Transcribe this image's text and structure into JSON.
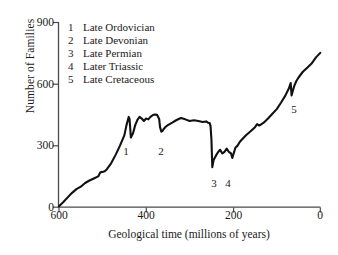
{
  "chart_data": {
    "type": "line",
    "title": "",
    "xlabel": "Geological time (millions of years)",
    "ylabel": "Number of Families",
    "xlim": [
      600,
      0
    ],
    "ylim": [
      0,
      900
    ],
    "x_ticks": [
      600,
      400,
      200,
      0
    ],
    "y_ticks": [
      0,
      300,
      600,
      900
    ],
    "x_reversed": true,
    "grid": false,
    "legend_position": "top-left-inside",
    "series_name": "Number of families",
    "line_color": "#000000",
    "x": [
      600,
      590,
      580,
      570,
      560,
      550,
      540,
      530,
      520,
      510,
      505,
      500,
      495,
      490,
      480,
      470,
      460,
      450,
      445,
      440,
      438,
      435,
      430,
      425,
      420,
      415,
      410,
      405,
      400,
      395,
      390,
      385,
      380,
      375,
      370,
      368,
      365,
      362,
      360,
      355,
      350,
      340,
      330,
      320,
      310,
      300,
      290,
      280,
      270,
      262,
      258,
      254,
      252,
      250,
      248,
      245,
      240,
      235,
      230,
      225,
      220,
      215,
      210,
      205,
      202,
      200,
      198,
      195,
      190,
      185,
      180,
      170,
      160,
      150,
      145,
      140,
      130,
      120,
      110,
      100,
      90,
      80,
      72,
      68,
      66,
      64,
      60,
      55,
      50,
      40,
      30,
      20,
      10,
      0
    ],
    "y": [
      5,
      25,
      48,
      70,
      88,
      100,
      118,
      130,
      140,
      150,
      170,
      172,
      175,
      185,
      215,
      255,
      300,
      350,
      400,
      440,
      430,
      340,
      360,
      400,
      425,
      440,
      432,
      420,
      432,
      428,
      440,
      448,
      452,
      450,
      430,
      390,
      368,
      372,
      380,
      392,
      400,
      412,
      425,
      435,
      428,
      420,
      424,
      420,
      415,
      418,
      412,
      410,
      395,
      330,
      195,
      230,
      250,
      268,
      280,
      262,
      270,
      285,
      270,
      262,
      240,
      255,
      268,
      290,
      300,
      318,
      330,
      352,
      370,
      390,
      405,
      398,
      412,
      432,
      455,
      478,
      510,
      545,
      580,
      605,
      545,
      560,
      590,
      615,
      632,
      660,
      680,
      700,
      730,
      752
    ],
    "annotations": [
      {
        "id": "1",
        "label": "Late Ordovician",
        "x": 438,
        "y": 340,
        "px": 126,
        "py": 152
      },
      {
        "id": "2",
        "label": "Late Devonian",
        "x": 367,
        "y": 365,
        "px": 161,
        "py": 152
      },
      {
        "id": "3",
        "label": "Late Permian",
        "x": 248,
        "y": 195,
        "px": 214,
        "py": 184
      },
      {
        "id": "4",
        "label": "Later Triassic",
        "x": 202,
        "y": 240,
        "px": 228,
        "py": 184
      },
      {
        "id": "5",
        "label": "Late Cretaceous",
        "x": 66,
        "y": 545,
        "px": 294,
        "py": 110
      }
    ]
  },
  "axes": {
    "x_title": "Geological time (millions of years)",
    "y_title": "Number of Families",
    "x_tick_labels": [
      "600",
      "400",
      "200",
      "0"
    ],
    "y_tick_labels": [
      "900",
      "600",
      "300",
      "0"
    ]
  },
  "legend": {
    "entries": [
      {
        "num": "1",
        "label": "Late Ordovician"
      },
      {
        "num": "2",
        "label": "Late Devonian"
      },
      {
        "num": "3",
        "label": "Late Permian"
      },
      {
        "num": "4",
        "label": "Later Triassic"
      },
      {
        "num": "5",
        "label": "Late Cretaceous"
      }
    ]
  },
  "markers": {
    "m1": "1",
    "m2": "2",
    "m3": "3",
    "m4": "4",
    "m5": "5"
  }
}
